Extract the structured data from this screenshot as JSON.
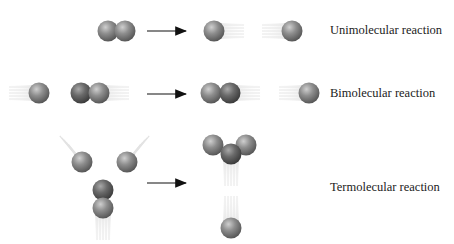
{
  "diagram": {
    "rows": [
      {
        "id": "unimolecular",
        "label": "Unimolecular reaction",
        "label_pos": [
          330,
          24
        ],
        "arrow": [
          147,
          31,
          186,
          31
        ],
        "reactants": [
          {
            "x": 108,
            "y": 31,
            "tone": "mid"
          },
          {
            "x": 125,
            "y": 31,
            "tone": "mid"
          }
        ],
        "products": [
          {
            "x": 214,
            "y": 31,
            "tone": "mid",
            "trail": "right"
          },
          {
            "x": 292,
            "y": 31,
            "tone": "mid",
            "trail": "left"
          }
        ]
      },
      {
        "id": "bimolecular",
        "label": "Bimolecular reaction",
        "label_pos": [
          330,
          87
        ],
        "arrow": [
          147,
          94,
          186,
          94
        ],
        "reactants": [
          {
            "x": 39,
            "y": 93,
            "tone": "mid",
            "trail": "left"
          },
          {
            "x": 81,
            "y": 93,
            "tone": "dark"
          },
          {
            "x": 99,
            "y": 93,
            "tone": "mid",
            "trail": "right"
          }
        ],
        "products": [
          {
            "x": 211,
            "y": 93,
            "tone": "mid"
          },
          {
            "x": 230,
            "y": 93,
            "tone": "dark",
            "trail": "right"
          },
          {
            "x": 309,
            "y": 93,
            "tone": "mid",
            "trail": "left"
          }
        ]
      },
      {
        "id": "termolecular",
        "label": "Termolecular reaction",
        "label_pos": [
          330,
          181
        ],
        "arrow": [
          147,
          183,
          186,
          183
        ],
        "reactants": [
          {
            "x": 82,
            "y": 162,
            "tone": "mid",
            "trail": "upleft"
          },
          {
            "x": 127,
            "y": 162,
            "tone": "mid",
            "trail": "upright"
          },
          {
            "x": 103,
            "y": 190,
            "tone": "dark"
          },
          {
            "x": 103,
            "y": 208,
            "tone": "mid",
            "trail": "down"
          }
        ],
        "products": [
          {
            "x": 213,
            "y": 145,
            "tone": "mid"
          },
          {
            "x": 246,
            "y": 145,
            "tone": "mid"
          },
          {
            "x": 231,
            "y": 154,
            "tone": "dark",
            "trail": "down"
          },
          {
            "x": 231,
            "y": 228,
            "tone": "mid",
            "trail": "up"
          }
        ]
      }
    ],
    "colors": {
      "sphere_mid": "#8a8a8a",
      "sphere_dark": "#6a6a6a",
      "highlight": "#d8d8d8",
      "arrow": "#111111",
      "trail": "#cfcfcf",
      "text": "#222222"
    }
  }
}
